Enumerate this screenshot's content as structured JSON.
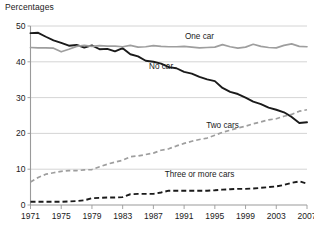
{
  "chart_data": {
    "type": "line",
    "title": "Percentages",
    "xlabel": "",
    "ylabel": "Percentages",
    "xlim": [
      1971,
      2007
    ],
    "ylim": [
      0,
      50
    ],
    "yticks": [
      0,
      10,
      20,
      30,
      40,
      50
    ],
    "grid": true,
    "legend_position": "inline-annotations",
    "x": [
      1971,
      1972,
      1973,
      1974,
      1975,
      1976,
      1977,
      1978,
      1979,
      1980,
      1981,
      1982,
      1983,
      1984,
      1985,
      1986,
      1987,
      1988,
      1989,
      1990,
      1991,
      1992,
      1993,
      1994,
      1995,
      1996,
      1997,
      1998,
      1999,
      2000,
      2001,
      2002,
      2003,
      2004,
      2005,
      2006,
      2007
    ],
    "series": [
      {
        "name": "No car",
        "style": "solid",
        "color": "#1a1a1a",
        "label_text": "No car",
        "values": [
          48.0,
          48.1,
          47.0,
          46.0,
          45.3,
          44.5,
          44.7,
          44.0,
          44.6,
          43.5,
          43.6,
          42.9,
          43.8,
          42.1,
          41.5,
          40.3,
          40.0,
          39.5,
          38.5,
          38.2,
          37.2,
          36.7,
          35.8,
          35.1,
          34.6,
          32.7,
          31.6,
          31.0,
          30.0,
          28.9,
          28.2,
          27.2,
          26.6,
          25.9,
          24.6,
          22.9,
          23.1
        ]
      },
      {
        "name": "One car",
        "style": "solid",
        "color": "#9e9e9e",
        "label_text": "One car",
        "values": [
          44.0,
          43.9,
          43.9,
          43.8,
          42.8,
          43.5,
          44.3,
          44.6,
          44.3,
          44.5,
          44.4,
          44.4,
          44.2,
          44.6,
          44.1,
          44.2,
          44.5,
          44.3,
          44.2,
          44.2,
          44.3,
          44.1,
          43.9,
          44.0,
          44.1,
          44.8,
          44.2,
          43.8,
          44.1,
          44.9,
          44.3,
          44.0,
          43.9,
          44.6,
          45.0,
          44.3,
          44.2
        ]
      },
      {
        "name": "Two cars",
        "style": "dashed",
        "color": "#9e9e9e",
        "label_text": "Two cars",
        "values": [
          6.4,
          7.7,
          8.6,
          9.0,
          9.4,
          9.6,
          9.6,
          9.8,
          9.9,
          10.7,
          11.4,
          12.0,
          12.5,
          13.5,
          13.7,
          14.1,
          14.5,
          15.3,
          15.7,
          16.5,
          17.2,
          17.8,
          18.3,
          18.7,
          19.5,
          20.3,
          20.9,
          21.5,
          22.0,
          22.7,
          23.2,
          23.8,
          24.1,
          24.8,
          25.3,
          26.2,
          26.6
        ]
      },
      {
        "name": "Three or more cars",
        "style": "dashed",
        "color": "#1a1a1a",
        "label_text": "Three or more cars",
        "values": [
          0.9,
          0.9,
          0.9,
          0.9,
          0.9,
          1.0,
          1.1,
          1.3,
          1.9,
          2.0,
          2.1,
          2.1,
          2.2,
          3.0,
          3.1,
          3.1,
          3.1,
          3.5,
          4.0,
          4.0,
          4.0,
          4.0,
          4.0,
          4.0,
          4.1,
          4.3,
          4.4,
          4.5,
          4.5,
          4.6,
          4.8,
          5.0,
          5.2,
          5.6,
          6.2,
          6.6,
          6.0
        ]
      }
    ],
    "xtick_labels": [
      "1971",
      "1975",
      "1979",
      "1983",
      "1987",
      "1991",
      "1995",
      "1999",
      "2003",
      "2007"
    ],
    "ytick_labels": [
      "0",
      "10",
      "20",
      "30",
      "40",
      "50"
    ],
    "annotations": [
      {
        "text": "One car",
        "x": 1993,
        "y": 46.5
      },
      {
        "text": "No car",
        "x": 1988,
        "y": 38.0
      },
      {
        "text": "Two cars",
        "x": 1996,
        "y": 21.5
      },
      {
        "text": "Three or more cars",
        "x": 1993,
        "y": 7.8
      }
    ]
  }
}
